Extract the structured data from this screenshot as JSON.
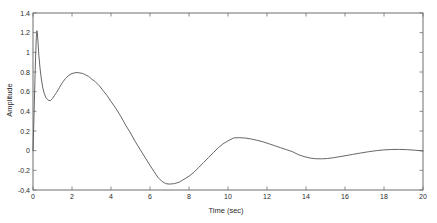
{
  "chart_data": {
    "type": "line",
    "title": "",
    "xlabel": "Time (sec)",
    "ylabel": "Amplitude",
    "xlim": [
      0,
      20
    ],
    "ylim": [
      -0.4,
      1.4
    ],
    "grid": false,
    "legend": null,
    "box": true,
    "xticks": [
      0,
      2,
      4,
      6,
      8,
      10,
      12,
      14,
      16,
      18,
      20
    ],
    "xtick_labels": [
      "0",
      "2",
      "4",
      "6",
      "8",
      "10",
      "12",
      "14",
      "16",
      "18",
      "20"
    ],
    "yticks": [
      -0.4,
      -0.2,
      0,
      0.2,
      0.4,
      0.6,
      0.8,
      1,
      1.2,
      1.4
    ],
    "ytick_labels": [
      "-0.4",
      "-0.2",
      "0",
      "0.2",
      "0.4",
      "0.6",
      "0.8",
      "1",
      "1.2",
      "1.4"
    ],
    "series": [
      {
        "name": "response",
        "color": "#555555",
        "x": [
          0.0,
          0.05,
          0.1,
          0.14,
          0.17,
          0.19,
          0.2,
          0.22,
          0.25,
          0.3,
          0.36,
          0.42,
          0.5,
          0.58,
          0.66,
          0.74,
          0.82,
          0.9,
          1.0,
          1.1,
          1.2,
          1.35,
          1.5,
          1.65,
          1.8,
          1.95,
          2.1,
          2.25,
          2.4,
          2.55,
          2.7,
          2.85,
          3.0,
          3.2,
          3.4,
          3.6,
          3.8,
          4.0,
          4.25,
          4.5,
          4.75,
          5.0,
          5.25,
          5.5,
          5.75,
          6.0,
          6.2,
          6.4,
          6.6,
          6.8,
          7.0,
          7.25,
          7.5,
          7.75,
          8.0,
          8.25,
          8.5,
          8.75,
          9.0,
          9.25,
          9.5,
          9.75,
          10.0,
          10.3,
          10.6,
          10.9,
          11.2,
          11.5,
          11.8,
          12.1,
          12.4,
          12.7,
          13.0,
          13.3,
          13.6,
          13.9,
          14.2,
          14.5,
          14.8,
          15.1,
          15.4,
          15.7,
          16.0,
          16.4,
          16.8,
          17.2,
          17.6,
          18.0,
          18.4,
          18.8,
          19.2,
          19.6,
          20.0
        ],
        "y": [
          0.0,
          0.34,
          0.72,
          1.0,
          1.15,
          1.2,
          1.22,
          1.2,
          1.12,
          0.97,
          0.84,
          0.74,
          0.64,
          0.58,
          0.54,
          0.52,
          0.51,
          0.51,
          0.53,
          0.56,
          0.59,
          0.64,
          0.69,
          0.73,
          0.76,
          0.78,
          0.79,
          0.795,
          0.79,
          0.785,
          0.77,
          0.755,
          0.73,
          0.7,
          0.66,
          0.61,
          0.56,
          0.5,
          0.43,
          0.35,
          0.26,
          0.18,
          0.09,
          0.01,
          -0.07,
          -0.15,
          -0.21,
          -0.27,
          -0.31,
          -0.335,
          -0.34,
          -0.335,
          -0.32,
          -0.29,
          -0.26,
          -0.22,
          -0.17,
          -0.12,
          -0.07,
          -0.02,
          0.03,
          0.07,
          0.1,
          0.13,
          0.132,
          0.128,
          0.118,
          0.105,
          0.09,
          0.07,
          0.05,
          0.03,
          0.01,
          -0.01,
          -0.04,
          -0.06,
          -0.075,
          -0.082,
          -0.083,
          -0.08,
          -0.072,
          -0.062,
          -0.052,
          -0.038,
          -0.024,
          -0.011,
          0.0,
          0.008,
          0.012,
          0.013,
          0.01,
          0.004,
          -0.003
        ]
      }
    ]
  },
  "axes": {
    "xlabel": "Time (sec)",
    "ylabel": "Amplitude"
  }
}
